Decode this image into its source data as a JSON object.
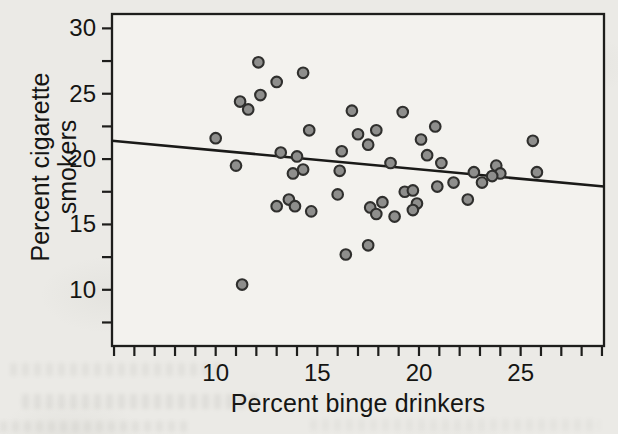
{
  "figure": {
    "xlabel": "Percent binge drinkers",
    "ylabel_line1": "Percent cigarette",
    "ylabel_line2": "smokers"
  },
  "chart_data": {
    "type": "scatter",
    "title": "",
    "xlabel": "Percent binge drinkers",
    "ylabel": "Percent cigarette smokers",
    "xlim": [
      4.9,
      29.1
    ],
    "ylim": [
      5.7,
      31.1
    ],
    "x_major_ticks": [
      10,
      15,
      20,
      25
    ],
    "x_minor_tick_step": 1,
    "x_minor_tick_range": [
      5,
      29
    ],
    "y_major_ticks": [
      10,
      15,
      20,
      25,
      30
    ],
    "y_minor_tick_step": 2.5,
    "y_minor_tick_range": [
      7.5,
      30
    ],
    "grid": false,
    "legend": false,
    "points": [
      [
        12.1,
        27.4
      ],
      [
        13.0,
        25.9
      ],
      [
        14.3,
        26.6
      ],
      [
        12.2,
        24.9
      ],
      [
        11.2,
        24.4
      ],
      [
        11.6,
        23.8
      ],
      [
        16.7,
        23.7
      ],
      [
        19.2,
        23.6
      ],
      [
        20.8,
        22.5
      ],
      [
        10.0,
        21.6
      ],
      [
        14.6,
        22.2
      ],
      [
        17.9,
        22.2
      ],
      [
        17.0,
        21.9
      ],
      [
        17.5,
        21.1
      ],
      [
        25.6,
        21.4
      ],
      [
        20.1,
        21.5
      ],
      [
        20.4,
        20.3
      ],
      [
        16.2,
        20.6
      ],
      [
        13.2,
        20.5
      ],
      [
        14.0,
        20.2
      ],
      [
        11.0,
        19.5
      ],
      [
        13.8,
        18.9
      ],
      [
        14.3,
        19.2
      ],
      [
        16.1,
        19.1
      ],
      [
        18.6,
        19.7
      ],
      [
        21.1,
        19.7
      ],
      [
        23.8,
        19.5
      ],
      [
        24.0,
        18.9
      ],
      [
        23.6,
        18.7
      ],
      [
        22.7,
        19.0
      ],
      [
        23.1,
        18.2
      ],
      [
        21.7,
        18.2
      ],
      [
        20.9,
        17.9
      ],
      [
        25.8,
        19.0
      ],
      [
        22.4,
        16.9
      ],
      [
        13.0,
        16.4
      ],
      [
        13.6,
        16.9
      ],
      [
        13.9,
        16.4
      ],
      [
        14.7,
        16.0
      ],
      [
        16.0,
        17.3
      ],
      [
        17.6,
        16.3
      ],
      [
        17.9,
        15.8
      ],
      [
        18.2,
        16.7
      ],
      [
        18.8,
        15.6
      ],
      [
        19.3,
        17.5
      ],
      [
        19.7,
        17.6
      ],
      [
        19.9,
        16.6
      ],
      [
        19.7,
        16.1
      ],
      [
        17.5,
        13.4
      ],
      [
        16.4,
        12.7
      ],
      [
        11.3,
        10.4
      ]
    ],
    "trend_line": {
      "type": "least-squares",
      "x1": 4.9,
      "y1": 21.4,
      "x2": 29.1,
      "y2": 17.9
    },
    "marker": {
      "shape": "circle",
      "fill": "#8e8e8c",
      "stroke": "#2f2f2d"
    },
    "colors": {
      "axis": "#1e1e1c",
      "text": "#151513",
      "plot_bg": "#f3f2ee",
      "page_bg": "#ebeae6",
      "trend_line": "#1a1a18"
    }
  }
}
